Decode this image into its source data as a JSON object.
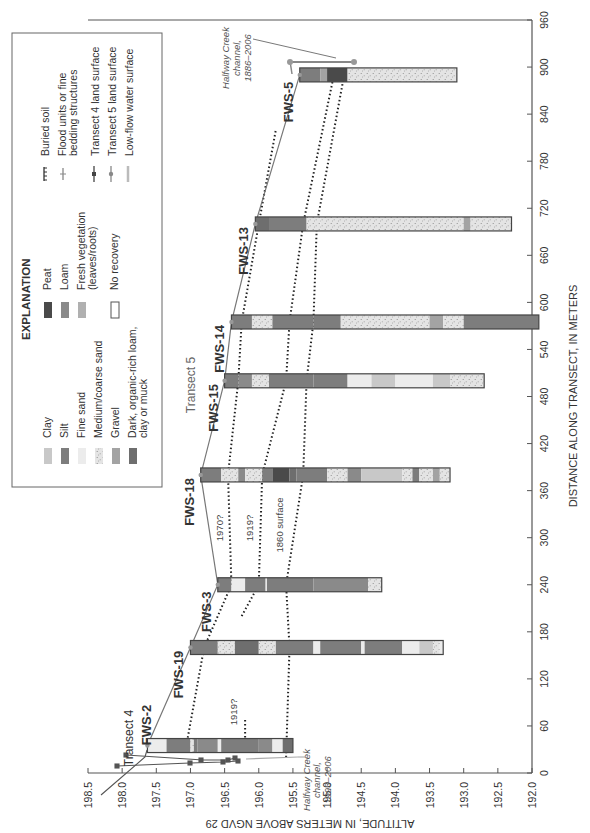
{
  "chart_data": {
    "type": "diagram-cross-section",
    "orientation": "rotated 90 degrees counter-clockwise",
    "title": "",
    "xlabel": "DISTANCE ALONG TRANSECT, IN METERS",
    "ylabel": "ALTITUDE, IN METERS ABOVE NGVD 29",
    "xlim": [
      0,
      960
    ],
    "ylim": [
      192.0,
      198.5
    ],
    "x_ticks": [
      "0",
      "60",
      "120",
      "180",
      "240",
      "300",
      "360",
      "420",
      "480",
      "540",
      "600",
      "660",
      "720",
      "780",
      "840",
      "900",
      "960"
    ],
    "y_ticks": [
      "198.5",
      "198.0",
      "197.5",
      "197.0",
      "196.5",
      "196.0",
      "195.5",
      "195.0",
      "194.5",
      "194.0",
      "193.5",
      "193.0",
      "192.5",
      "192.0"
    ],
    "cores": [
      {
        "name": "FWS-2",
        "distance": 35,
        "top": 197.63,
        "bottom": 195.5,
        "units": [
          [
            "fine_sand",
            197.63,
            197.35
          ],
          [
            "silt",
            197.35,
            197.0
          ],
          [
            "medium_sand",
            197.0,
            196.95
          ],
          [
            "silt",
            196.95,
            196.9
          ],
          [
            "loam",
            196.9,
            196.6
          ],
          [
            "fine_sand",
            196.6,
            196.55
          ],
          [
            "silt",
            196.55,
            196.0
          ],
          [
            "loam",
            196.0,
            195.8
          ],
          [
            "fine_sand",
            195.8,
            195.65
          ],
          [
            "dark_organic",
            195.65,
            195.5
          ]
        ]
      },
      {
        "name": "FWS-19",
        "distance": 160,
        "top": 197.0,
        "bottom": 193.3,
        "units": [
          [
            "silt",
            197.0,
            196.6
          ],
          [
            "medium_sand",
            196.6,
            196.35
          ],
          [
            "dark_organic",
            196.35,
            196.0
          ],
          [
            "medium_sand",
            196.0,
            195.75
          ],
          [
            "silt",
            195.75,
            195.2
          ],
          [
            "fine_sand",
            195.2,
            195.1
          ],
          [
            "silt",
            195.1,
            194.5
          ],
          [
            "fine_sand",
            194.5,
            194.45
          ],
          [
            "silt",
            194.45,
            193.9
          ],
          [
            "fine_sand",
            193.9,
            193.65
          ],
          [
            "clay",
            193.65,
            193.45
          ],
          [
            "medium_sand",
            193.45,
            193.35
          ],
          [
            "fine_sand",
            193.35,
            193.3
          ]
        ]
      },
      {
        "name": "FWS-3",
        "distance": 240,
        "top": 196.6,
        "bottom": 194.2,
        "units": [
          [
            "silt",
            196.6,
            196.4
          ],
          [
            "fine_sand",
            196.4,
            196.2
          ],
          [
            "silt",
            196.2,
            195.9
          ],
          [
            "fine_sand",
            195.9,
            195.88
          ],
          [
            "silt",
            195.88,
            195.2
          ],
          [
            "loam",
            195.2,
            194.4
          ],
          [
            "medium_sand",
            194.4,
            194.2
          ]
        ]
      },
      {
        "name": "FWS-18",
        "distance": 380,
        "top": 196.85,
        "bottom": 193.2,
        "units": [
          [
            "silt",
            196.85,
            196.55
          ],
          [
            "medium_sand",
            196.55,
            196.3
          ],
          [
            "loam",
            196.3,
            196.2
          ],
          [
            "medium_sand",
            196.2,
            195.95
          ],
          [
            "silt",
            195.95,
            195.8
          ],
          [
            "peat",
            195.8,
            195.55
          ],
          [
            "dark_organic",
            195.55,
            195.45
          ],
          [
            "silt",
            195.45,
            195.0
          ],
          [
            "medium_sand",
            195.0,
            194.7
          ],
          [
            "loam",
            194.7,
            194.5
          ],
          [
            "clay",
            194.5,
            193.9
          ],
          [
            "medium_sand",
            193.9,
            193.75
          ],
          [
            "silt",
            193.75,
            193.65
          ],
          [
            "medium_sand",
            193.65,
            193.45
          ],
          [
            "gravel",
            193.45,
            193.35
          ],
          [
            "medium_sand",
            193.35,
            193.2
          ]
        ]
      },
      {
        "name": "FWS-15",
        "distance": 500,
        "top": 196.5,
        "bottom": 192.7,
        "units": [
          [
            "silt",
            196.5,
            196.3
          ],
          [
            "loam",
            196.3,
            196.1
          ],
          [
            "medium_sand",
            196.1,
            195.85
          ],
          [
            "silt",
            195.85,
            195.2
          ],
          [
            "silt",
            195.2,
            194.7
          ],
          [
            "fine_sand",
            194.7,
            194.35
          ],
          [
            "clay",
            194.35,
            194.0
          ],
          [
            "fine_sand",
            194.0,
            193.45
          ],
          [
            "clay",
            193.45,
            193.2
          ],
          [
            "medium_sand",
            193.2,
            192.7
          ]
        ]
      },
      {
        "name": "FWS-14",
        "distance": 575,
        "top": 196.4,
        "bottom": 191.9,
        "units": [
          [
            "silt",
            196.4,
            196.1
          ],
          [
            "medium_sand",
            196.1,
            195.8
          ],
          [
            "silt",
            195.8,
            195.2
          ],
          [
            "silt",
            195.2,
            194.8
          ],
          [
            "medium_sand",
            194.8,
            194.2
          ],
          [
            "medium_sand",
            194.2,
            193.5
          ],
          [
            "gravel",
            193.5,
            193.3
          ],
          [
            "medium_sand",
            193.3,
            193.0
          ],
          [
            "silt",
            193.0,
            191.9
          ]
        ]
      },
      {
        "name": "FWS-13",
        "distance": 700,
        "top": 196.05,
        "bottom": 192.3,
        "units": [
          [
            "dark_organic",
            196.05,
            195.85
          ],
          [
            "silt",
            195.85,
            195.3
          ],
          [
            "medium_sand",
            195.3,
            195.1
          ],
          [
            "medium_sand",
            195.1,
            193.0
          ],
          [
            "gravel",
            193.0,
            192.9
          ],
          [
            "medium_sand",
            192.9,
            192.3
          ]
        ]
      },
      {
        "name": "FWS-5",
        "distance": 890,
        "top": 195.4,
        "bottom": 193.1,
        "units": [
          [
            "silt",
            195.4,
            195.1
          ],
          [
            "gravel",
            195.1,
            195.0
          ],
          [
            "peat",
            195.0,
            194.7
          ],
          [
            "medium_sand",
            194.7,
            193.9
          ],
          [
            "medium_sand",
            193.9,
            193.1
          ]
        ]
      }
    ],
    "transect5_land_surface": [
      [
        35,
        197.63
      ],
      [
        160,
        197.0
      ],
      [
        240,
        196.6
      ],
      [
        380,
        196.85
      ],
      [
        500,
        196.5
      ],
      [
        575,
        196.4
      ],
      [
        700,
        196.05
      ],
      [
        890,
        195.4
      ]
    ],
    "horizons": [
      {
        "label": "1970?",
        "points": [
          [
            40,
            197.05
          ],
          [
            160,
            196.8
          ],
          [
            240,
            196.4
          ],
          [
            380,
            196.45
          ],
          [
            500,
            196.3
          ],
          [
            575,
            196.25
          ],
          [
            700,
            196.0
          ],
          [
            820,
            195.75
          ]
        ]
      },
      {
        "label": "1919?",
        "points": [
          [
            200,
            196.25
          ],
          [
            240,
            196.0
          ],
          [
            380,
            195.95
          ],
          [
            500,
            195.6
          ],
          [
            575,
            195.55
          ],
          [
            700,
            195.35
          ],
          [
            890,
            194.9
          ]
        ]
      },
      {
        "label": "1919?",
        "points": [
          [
            30,
            196.2
          ],
          [
            70,
            196.2
          ]
        ]
      },
      {
        "label": "1860 surface",
        "points": [
          [
            20,
            195.6
          ],
          [
            160,
            195.55
          ],
          [
            240,
            195.6
          ],
          [
            380,
            195.35
          ],
          [
            500,
            195.3
          ],
          [
            575,
            195.2
          ],
          [
            700,
            195.15
          ],
          [
            890,
            194.75
          ]
        ]
      }
    ],
    "annotations": [
      "Transect 4",
      "Transect 5",
      "Halfway Creek channel, 1993–2006",
      "Halfway Creek channel, 1886–2006"
    ]
  },
  "axis": {
    "x_label": "DISTANCE ALONG TRANSECT, IN METERS",
    "y_label": "ALTITUDE, IN METERS ABOVE NGVD 29"
  },
  "labels": {
    "transect4": "Transect 4",
    "transect5": "Transect 5",
    "creek_1993_l1": "Halfway Creek",
    "creek_1993_l2": "channel,",
    "creek_1993_l3": "1993–2006",
    "creek_1886_l1": "Halfway Creek",
    "creek_1886_l2": "channel,",
    "creek_1886_l3": "1886–2006",
    "h1970": "1970?",
    "h1919": "1919?",
    "h1919b": "1919?",
    "h1860": "1860 surface"
  },
  "legend": {
    "title": "EXPLANATION",
    "col1": [
      {
        "label": "Clay",
        "color": "#c8c8c8"
      },
      {
        "label": "Silt",
        "color": "#7d7d7d"
      },
      {
        "label": "Fine sand",
        "color": "#ececec"
      },
      {
        "label": "Medium/coarse sand",
        "color": "pattern"
      },
      {
        "label": "Gravel",
        "color": "#a3a3a3"
      },
      {
        "label": "Dark, organic-rich loam,",
        "label2": "clay or muck",
        "color": "#6e6e6e"
      }
    ],
    "col2": [
      {
        "label": "Peat",
        "color": "#4a4a4a"
      },
      {
        "label": "Loam",
        "color": "#8a8a8a"
      },
      {
        "label": "Fresh vegetation",
        "label2": "(leaves/roots)",
        "color": "#b0b0b0"
      },
      {
        "label": "No recovery",
        "color": "#ffffff"
      }
    ],
    "col3": [
      {
        "label": "Buried soil"
      },
      {
        "label": "Flood units or fine",
        "label2": "bedding structures"
      },
      {
        "label": "Transect 4 land surface"
      },
      {
        "label": "Transect 5 land surface"
      },
      {
        "label": "Low-flow water surface"
      }
    ]
  }
}
